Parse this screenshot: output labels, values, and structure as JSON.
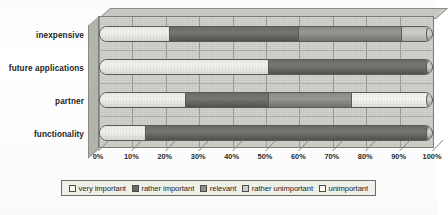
{
  "chart_data": {
    "type": "bar",
    "orientation": "horizontal",
    "stacked": true,
    "normalized_percent": true,
    "title": "",
    "subtitle": "",
    "xlabel": "",
    "ylabel": "",
    "xlim": [
      0,
      100
    ],
    "grid": true,
    "legend_position": "bottom",
    "categories": [
      "functionality",
      "partner",
      "future applications",
      "inexpensive"
    ],
    "categories_top_to_bottom": [
      "inexpensive",
      "future applications",
      "partner",
      "functionality"
    ],
    "tick_labels": [
      "0%",
      "10%",
      "20%",
      "30%",
      "40%",
      "50%",
      "60%",
      "70%",
      "80%",
      "90%",
      "100%"
    ],
    "tick_values": [
      0,
      10,
      20,
      30,
      40,
      50,
      60,
      70,
      80,
      90,
      100
    ],
    "series": [
      {
        "name": "very important",
        "swatch": "s0",
        "color": "#fbfbf6",
        "values_top_to_bottom": [
          21,
          51,
          26,
          14
        ]
      },
      {
        "name": "rather important",
        "swatch": "s1",
        "color": "#6d6d68",
        "values_top_to_bottom": [
          39,
          49,
          25,
          86
        ]
      },
      {
        "name": "relevant",
        "swatch": "s2",
        "color": "#919189",
        "values_top_to_bottom": [
          31,
          0,
          25,
          0
        ]
      },
      {
        "name": "rather unimportant",
        "swatch": "s3",
        "color": "#d2d2cc",
        "values_top_to_bottom": [
          9,
          0,
          0,
          0
        ]
      },
      {
        "name": "unimportant",
        "swatch": "s4",
        "color": "#fdfdf9",
        "values_top_to_bottom": [
          0,
          0,
          24,
          0
        ]
      }
    ],
    "bars": [
      {
        "category": "inexpensive",
        "segments": [
          {
            "series": "very important",
            "value": 21,
            "start": 0,
            "end": 21,
            "swatch": "s0"
          },
          {
            "series": "rather important",
            "value": 39,
            "start": 21,
            "end": 60,
            "swatch": "s1"
          },
          {
            "series": "relevant",
            "value": 31,
            "start": 60,
            "end": 91,
            "swatch": "s2"
          },
          {
            "series": "rather unimportant",
            "value": 9,
            "start": 91,
            "end": 100,
            "swatch": "s3"
          }
        ]
      },
      {
        "category": "future applications",
        "segments": [
          {
            "series": "very important",
            "value": 51,
            "start": 0,
            "end": 51,
            "swatch": "s0"
          },
          {
            "series": "rather important",
            "value": 49,
            "start": 51,
            "end": 100,
            "swatch": "s1"
          }
        ]
      },
      {
        "category": "partner",
        "segments": [
          {
            "series": "very important",
            "value": 26,
            "start": 0,
            "end": 26,
            "swatch": "s0"
          },
          {
            "series": "rather important",
            "value": 25,
            "start": 26,
            "end": 51,
            "swatch": "s1"
          },
          {
            "series": "relevant",
            "value": 25,
            "start": 51,
            "end": 76,
            "swatch": "s2"
          },
          {
            "series": "unimportant",
            "value": 24,
            "start": 76,
            "end": 100,
            "swatch": "s4"
          }
        ]
      },
      {
        "category": "functionality",
        "segments": [
          {
            "series": "very important",
            "value": 14,
            "start": 0,
            "end": 14,
            "swatch": "s0"
          },
          {
            "series": "rather important",
            "value": 86,
            "start": 14,
            "end": 100,
            "swatch": "s1"
          }
        ]
      }
    ],
    "legend": [
      {
        "label": "very important",
        "swatch": "s0"
      },
      {
        "label": "rather important",
        "swatch": "s1"
      },
      {
        "label": "relevant",
        "swatch": "s2"
      },
      {
        "label": "rather unimportant",
        "swatch": "s3"
      },
      {
        "label": "unimportant",
        "swatch": "s4"
      }
    ]
  }
}
